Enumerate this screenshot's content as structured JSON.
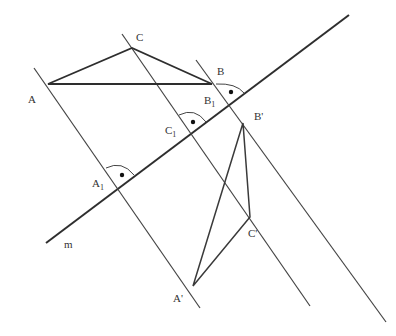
{
  "figure": {
    "colors": {
      "line": "#3a3a3a",
      "thick": "#2e2e2e",
      "background": "#ffffff"
    },
    "labels": {
      "A": "A",
      "B": "B",
      "C": "C",
      "A1": "A",
      "A1_sub": "1",
      "B1": "B",
      "B1_sub": "1",
      "C1": "C",
      "C1_sub": "1",
      "A_prime": "A'",
      "B_prime": "B'",
      "C_prime": "C'",
      "m": "m"
    },
    "points": {
      "A": [
        48,
        84
      ],
      "B": [
        212,
        84
      ],
      "C": [
        132,
        48
      ],
      "A1": [
        120,
        187
      ],
      "B1": [
        232,
        103
      ],
      "C1": [
        193,
        132
      ],
      "A_prime": [
        193,
        286
      ],
      "B_prime": [
        243,
        123
      ],
      "C_prime": [
        250,
        217
      ]
    },
    "right_angle_marks": [
      "A1",
      "C1",
      "B1"
    ]
  }
}
